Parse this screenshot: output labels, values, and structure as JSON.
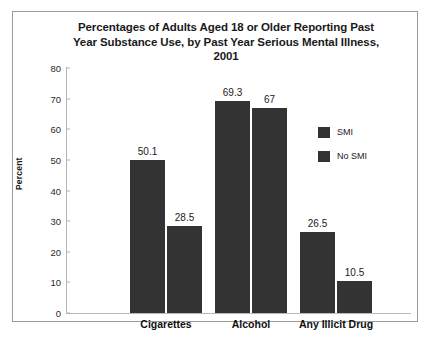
{
  "chart_data": {
    "type": "bar",
    "title": "Percentages of Adults Aged 18 or Older Reporting Past Year Substance Use, by Past Year Serious Mental Illness, 2001",
    "title_lines": [
      "Percentages of Adults Aged 18 or Older Reporting Past",
      "Year Substance Use, by Past Year Serious Mental Illness,",
      "2001"
    ],
    "xlabel": "",
    "ylabel": "Percent",
    "ylim": [
      0,
      80
    ],
    "yticks": [
      0,
      10,
      20,
      30,
      40,
      50,
      60,
      70,
      80
    ],
    "ytick_labels": [
      "0",
      "10",
      "20",
      "30",
      "40",
      "50",
      "60",
      "70",
      "80"
    ],
    "grid": false,
    "legend_position": "right",
    "categories": [
      "Cigarettes",
      "Alcohol",
      "Any Illicit Drug"
    ],
    "series": [
      {
        "name": "SMI",
        "values": [
          50.1,
          69.3,
          26.5
        ],
        "color": "#333333"
      },
      {
        "name": "No SMI",
        "values": [
          28.5,
          67,
          10.5
        ],
        "color": "#333333"
      }
    ],
    "bars": [
      {
        "category": "Cigarettes",
        "series": "SMI",
        "value": 50.1,
        "label": "50.1"
      },
      {
        "category": "Cigarettes",
        "series": "No SMI",
        "value": 28.5,
        "label": "28.5"
      },
      {
        "category": "Alcohol",
        "series": "SMI",
        "value": 69.3,
        "label": "69.3"
      },
      {
        "category": "Alcohol",
        "series": "No SMI",
        "value": 67,
        "label": "67"
      },
      {
        "category": "Any Illicit Drug",
        "series": "SMI",
        "value": 26.5,
        "label": "26.5"
      },
      {
        "category": "Any Illicit Drug",
        "series": "No SMI",
        "value": 10.5,
        "label": "10.5"
      }
    ]
  },
  "legend": {
    "items": [
      {
        "label": "SMI"
      },
      {
        "label": "No SMI"
      }
    ]
  }
}
